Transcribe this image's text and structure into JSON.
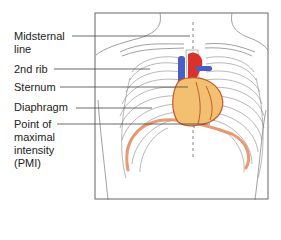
{
  "figure": {
    "labels": [
      {
        "id": "midsternal-line",
        "lines": [
          "Midsternal",
          "line"
        ]
      },
      {
        "id": "2nd-rib",
        "lines": [
          "2nd rib"
        ]
      },
      {
        "id": "sternum",
        "lines": [
          "Sternum"
        ]
      },
      {
        "id": "diaphragm",
        "lines": [
          "Diaphragm"
        ]
      },
      {
        "id": "pmi",
        "lines": [
          "Point of",
          "maximal",
          "intensity",
          "(PMI)"
        ]
      }
    ],
    "colors": {
      "outline": "#555555",
      "frame": "#666666",
      "leader": "#444444",
      "diaphragm": "#e8875a",
      "heart_fill": "#f2c070",
      "heart_edge": "#c8552a",
      "vein": "#4a5ec8",
      "artery": "#d8322a"
    }
  }
}
